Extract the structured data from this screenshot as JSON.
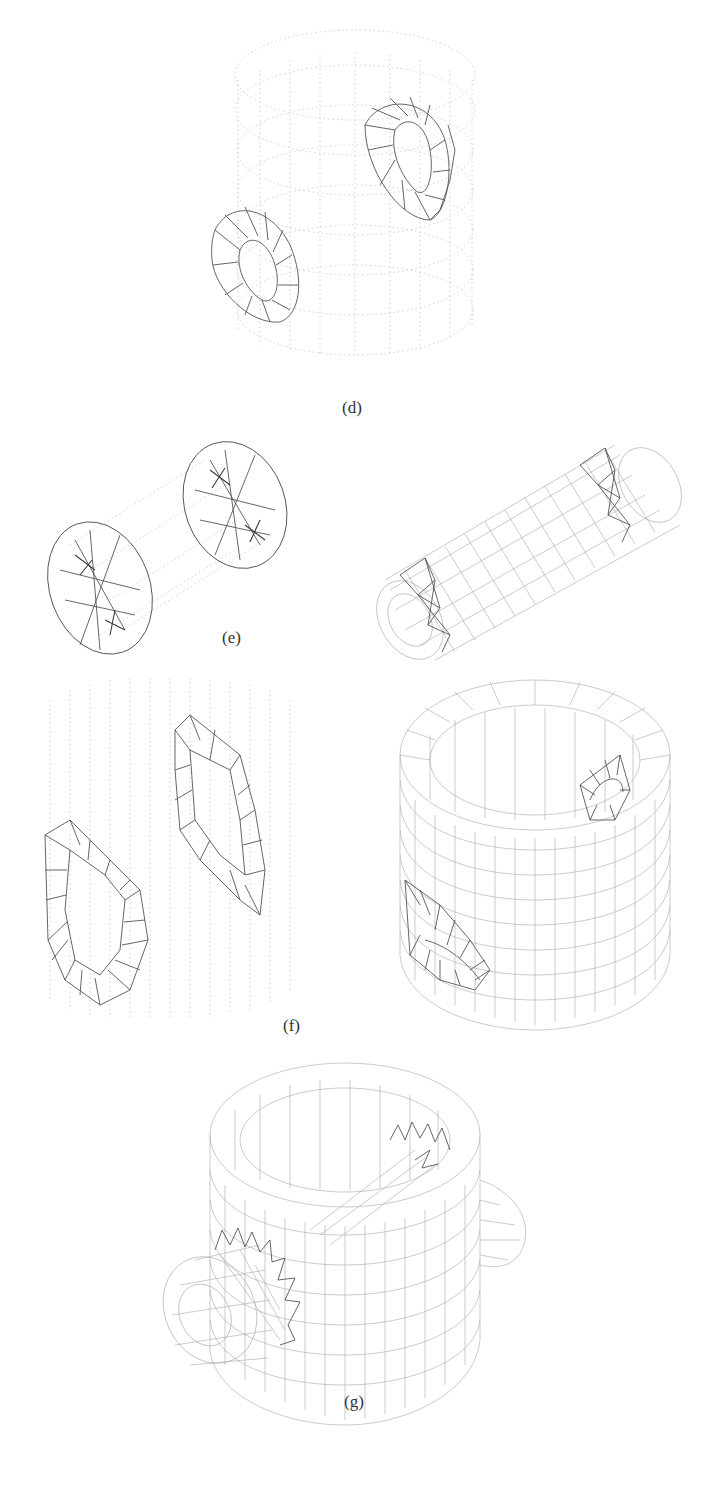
{
  "figure": {
    "panels": [
      {
        "id": "d",
        "label": "(d)",
        "description": "Faint wireframe cylinder with two dark tetrahedral ring meshes (hole boundaries)"
      },
      {
        "id": "e",
        "label": "(e)",
        "left_description": "Faint tube with two dense dark mesh ends",
        "right_description": "Hex-mesh horizontal tube with two tetrahedral ring bands"
      },
      {
        "id": "f",
        "label": "(f)",
        "left_description": "Faint cylinder slice with two tetrahedral hole regions",
        "right_description": "Hex-mesh hollow cylinder with two side holes"
      },
      {
        "id": "g",
        "label": "(g)",
        "description": "Hex-mesh hollow cylinder with a horizontal pipe passing through, ends protruding"
      }
    ]
  }
}
